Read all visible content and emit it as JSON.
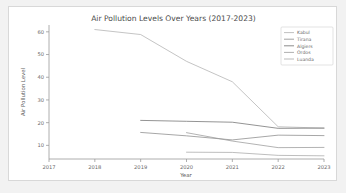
{
  "figure": {
    "background": "#ffffff",
    "page_background": "#f2f2f2",
    "border_color": "#d8d8d8"
  },
  "chart_data": {
    "type": "line",
    "title": "Air Pollution Levels Over Years (2017-2023)",
    "xlabel": "Year",
    "ylabel": "Air Pollution Level",
    "x": [
      2017,
      2018,
      2019,
      2020,
      2021,
      2022,
      2023
    ],
    "xlim": [
      2017,
      2023
    ],
    "ylim": [
      4,
      63
    ],
    "xticks": [
      "2017",
      "2018",
      "2019",
      "2020",
      "2021",
      "2022",
      "2023"
    ],
    "yticks": [
      "10",
      "20",
      "30",
      "40",
      "50",
      "60"
    ],
    "ytick_values": [
      10,
      20,
      30,
      40,
      50,
      60
    ],
    "grid": false,
    "legend_position": "upper right",
    "series": [
      {
        "name": "Kabul",
        "color": "#b0b0b0",
        "values": [
          null,
          61.0,
          58.8,
          47.0,
          38.0,
          18.2,
          17.6
        ]
      },
      {
        "name": "Tirana",
        "color": "#8a8a8a",
        "values": [
          null,
          null,
          15.7,
          14.2,
          12.4,
          14.5,
          14.3
        ]
      },
      {
        "name": "Algiers",
        "color": "#707070",
        "values": [
          null,
          null,
          21.0,
          20.6,
          20.2,
          17.5,
          17.6
        ]
      },
      {
        "name": "Ordos",
        "color": "#9a9a9a",
        "values": [
          null,
          null,
          null,
          15.6,
          11.9,
          9.0,
          9.1
        ]
      },
      {
        "name": "Luanda",
        "color": "#a8a8a8",
        "values": [
          null,
          null,
          null,
          7.0,
          6.9,
          5.6,
          5.4
        ]
      }
    ]
  }
}
